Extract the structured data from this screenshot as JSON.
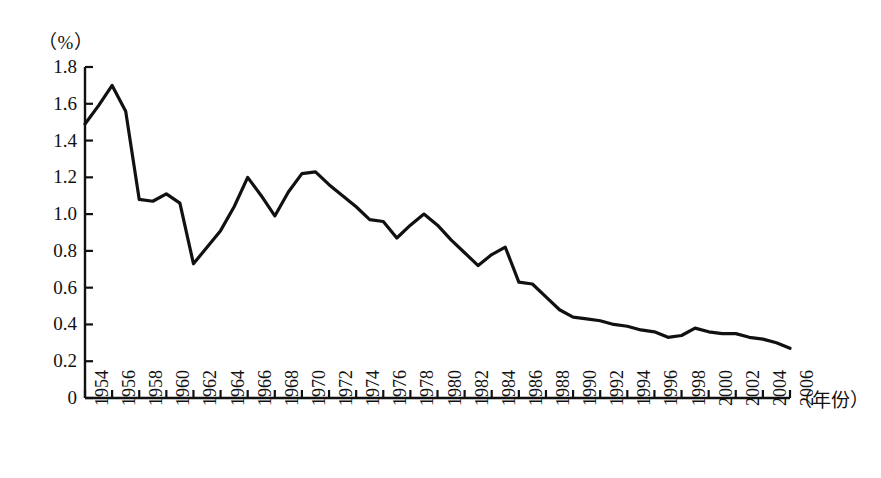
{
  "chart_data": {
    "type": "line",
    "title": "",
    "subtitle": "",
    "unit_label": "（%）",
    "xlabel": "（年份）",
    "ylabel": "",
    "grid": false,
    "legend": false,
    "xlim": [
      1954,
      2006
    ],
    "ylim": [
      0,
      1.8
    ],
    "ytick_labels": [
      "0",
      "0.2",
      "0.4",
      "0.6",
      "0.8",
      "1.0",
      "1.2",
      "1.4",
      "1.6",
      "1.8"
    ],
    "ytick_values": [
      0,
      0.2,
      0.4,
      0.6,
      0.8,
      1.0,
      1.2,
      1.4,
      1.6,
      1.8
    ],
    "xtick_labels": [
      "1954",
      "1956",
      "1958",
      "1960",
      "1962",
      "1964",
      "1966",
      "1968",
      "1970",
      "1972",
      "1974",
      "1976",
      "1978",
      "1980",
      "1982",
      "1984",
      "1986",
      "1988",
      "1990",
      "1992",
      "1994",
      "1996",
      "1998",
      "2000",
      "2002",
      "2004",
      "2006"
    ],
    "xtick_values": [
      1954,
      1956,
      1958,
      1960,
      1962,
      1964,
      1966,
      1968,
      1970,
      1972,
      1974,
      1976,
      1978,
      1980,
      1982,
      1984,
      1986,
      1988,
      1990,
      1992,
      1994,
      1996,
      1998,
      2000,
      2002,
      2004,
      2006
    ],
    "line_color": "#111111",
    "line_width": 3.2,
    "x": [
      1954,
      1955,
      1956,
      1957,
      1958,
      1959,
      1960,
      1961,
      1962,
      1963,
      1964,
      1965,
      1966,
      1967,
      1968,
      1969,
      1970,
      1971,
      1972,
      1973,
      1974,
      1975,
      1976,
      1977,
      1978,
      1979,
      1980,
      1981,
      1982,
      1983,
      1984,
      1985,
      1986,
      1987,
      1988,
      1989,
      1990,
      1991,
      1992,
      1993,
      1994,
      1995,
      1996,
      1997,
      1998,
      1999,
      2000,
      2001,
      2002,
      2003,
      2004,
      2005,
      2006
    ],
    "y": [
      1.49,
      1.59,
      1.7,
      1.56,
      1.08,
      1.07,
      1.11,
      1.06,
      0.73,
      0.82,
      0.91,
      1.04,
      1.2,
      1.1,
      0.99,
      1.12,
      1.22,
      1.23,
      1.16,
      1.1,
      1.04,
      0.97,
      0.96,
      0.87,
      0.94,
      1.0,
      0.94,
      0.86,
      0.79,
      0.72,
      0.78,
      0.82,
      0.63,
      0.62,
      0.55,
      0.48,
      0.44,
      0.43,
      0.42,
      0.4,
      0.39,
      0.37,
      0.36,
      0.33,
      0.34,
      0.38,
      0.36,
      0.35,
      0.35,
      0.33,
      0.32,
      0.3,
      0.27
    ],
    "series": [
      {
        "name": "rate",
        "values": [
          1.49,
          1.59,
          1.7,
          1.56,
          1.08,
          1.07,
          1.11,
          1.06,
          0.73,
          0.82,
          0.91,
          1.04,
          1.2,
          1.1,
          0.99,
          1.12,
          1.22,
          1.23,
          1.16,
          1.1,
          1.04,
          0.97,
          0.96,
          0.87,
          0.94,
          1.0,
          0.94,
          0.86,
          0.79,
          0.72,
          0.78,
          0.82,
          0.63,
          0.62,
          0.55,
          0.48,
          0.44,
          0.43,
          0.42,
          0.4,
          0.39,
          0.37,
          0.36,
          0.33,
          0.34,
          0.38,
          0.36,
          0.35,
          0.35,
          0.33,
          0.32,
          0.3,
          0.27
        ]
      }
    ]
  }
}
